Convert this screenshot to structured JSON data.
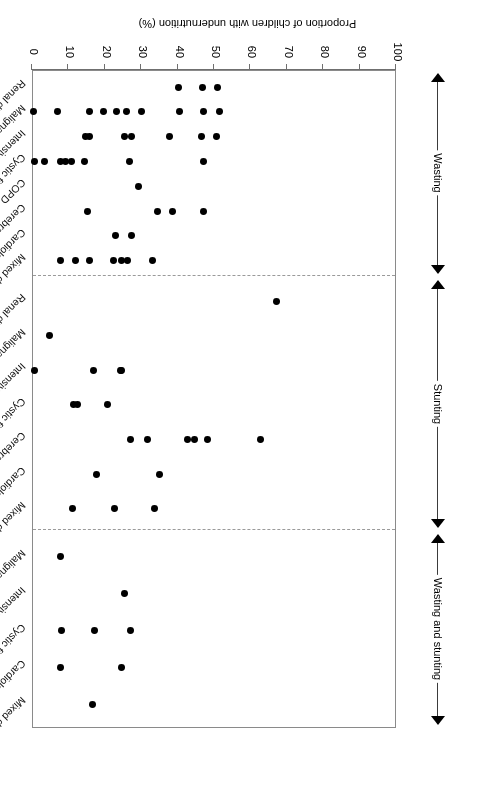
{
  "chart_data": {
    "type": "scatter",
    "title": "",
    "xlabel": "Proportion of children with undernutrition (%)",
    "ylabel": "",
    "xlim": [
      100,
      0
    ],
    "x_ticks": [
      100,
      90,
      80,
      70,
      60,
      50,
      40,
      30,
      20,
      10,
      0
    ],
    "grid": false,
    "legend": null,
    "axis_note": "Value axis runs 100 on the left to 0 on the right; figure is printed upside-down (rotated 180 degrees).",
    "groups": [
      {
        "name": "Wasting",
        "categories": [
          {
            "label": "Mixed diagnoses",
            "values": [
              33.3,
              26.5,
              24.8,
              22.8,
              16.0,
              12.2,
              8.0
            ]
          },
          {
            "label": "Cardiology",
            "values": [
              27.6,
              23.3
            ]
          },
          {
            "label": "Cerebral palsy",
            "values": [
              47.5,
              39.0,
              34.8,
              15.6
            ]
          },
          {
            "label": "COPD",
            "values": [
              29.5
            ]
          },
          {
            "label": "Cystic fibrosis",
            "values": [
              47.3,
              27.0,
              14.7,
              11.2,
              9.5,
              8.1,
              3.7,
              1.0
            ]
          },
          {
            "label": "Intensive care",
            "values": [
              51.0,
              46.8,
              38.0,
              27.6,
              25.6,
              16.2,
              15.0
            ]
          },
          {
            "label": "Malignancy",
            "values": [
              51.7,
              47.5,
              40.7,
              30.3,
              26.2,
              23.4,
              20.0,
              16.2,
              7.4,
              0.8
            ]
          },
          {
            "label": "Renal disease",
            "values": [
              51.3,
              47.0,
              40.5
            ]
          }
        ]
      },
      {
        "name": "Stunting",
        "categories": [
          {
            "label": "Mixed diagnoses",
            "values": [
              33.9,
              23.0,
              11.4
            ]
          },
          {
            "label": "Cardiology",
            "values": [
              35.2,
              18.0
            ]
          },
          {
            "label": "Cerebral palsy",
            "values": [
              63.0,
              48.5,
              44.8,
              43.0,
              32.0,
              27.3
            ]
          },
          {
            "label": "Cystic fibrosis",
            "values": [
              21.0,
              12.8,
              11.6
            ]
          },
          {
            "label": "Intensive care",
            "values": [
              25.0,
              24.6,
              17.2,
              0.9
            ]
          },
          {
            "label": "Malignancy",
            "values": [
              5.0
            ]
          },
          {
            "label": "Renal disease",
            "values": [
              67.5
            ]
          }
        ]
      },
      {
        "name": "Wasting and stunting",
        "categories": [
          {
            "label": "Mixed diagnoses",
            "values": [
              17.0
            ]
          },
          {
            "label": "Cardiology",
            "values": [
              25.0,
              8.2
            ]
          },
          {
            "label": "Cystic fibrosis",
            "values": [
              27.3,
              17.5,
              8.3
            ]
          },
          {
            "label": "Intensive care",
            "values": [
              25.6
            ]
          },
          {
            "label": "Malignancy",
            "values": [
              8.2
            ]
          }
        ]
      }
    ]
  },
  "axis": {
    "title": "Proportion of children with undernutrition (%)"
  }
}
